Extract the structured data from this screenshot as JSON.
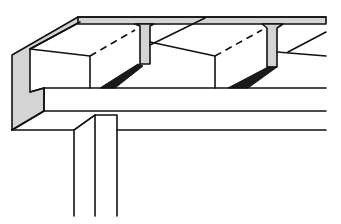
{
  "figure": {
    "colors": {
      "line": "#111111",
      "concrete_section": "#d4d4d4",
      "joint_fill": "#1a1a1a",
      "background": "#ffffff"
    },
    "elements": [
      {
        "name": "top-slab",
        "description": "Thin top slab with T-shaped ribs"
      },
      {
        "name": "filler-block",
        "count": 2,
        "description": "Hollow filler blocks between ribs"
      },
      {
        "name": "rib-joint",
        "count": 2,
        "description": "Dark mortar joints at base of ribs"
      },
      {
        "name": "end-section",
        "description": "Gray cut section of slab at left edge"
      },
      {
        "name": "support-beam",
        "description": "Horizontal beam supporting the slab"
      },
      {
        "name": "column",
        "description": "Vertical column under the beam"
      }
    ]
  }
}
